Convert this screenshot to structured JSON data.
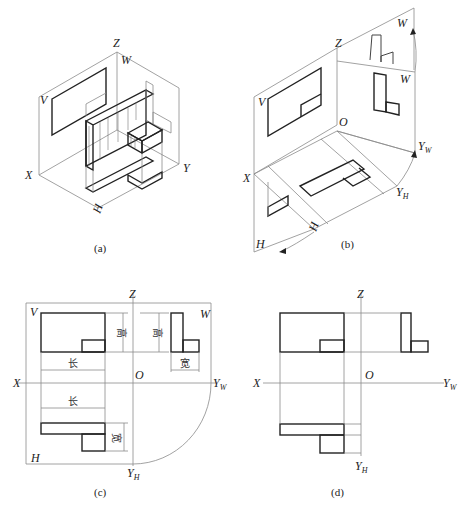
{
  "figure": {
    "panels": [
      {
        "id": "a",
        "caption": "(a)",
        "description": "Isometric view of object placed inside three-projection-plane system",
        "labels": {
          "Z": "Z",
          "W": "W",
          "V": "V",
          "X": "X",
          "Y": "Y",
          "H": "H"
        }
      },
      {
        "id": "b",
        "caption": "(b)",
        "description": "Unfolding of the projection planes (H rotates down, W rotates right)",
        "labels": {
          "Z": "Z",
          "W_top": "W",
          "W": "W",
          "V": "V",
          "O": "O",
          "X": "X",
          "YW": "Y",
          "YW_sub": "W",
          "YH": "Y",
          "YH_sub": "H",
          "H_plane": "H",
          "H": "H"
        }
      },
      {
        "id": "c",
        "caption": "(c)",
        "description": "Unfolded three-view drawing with dimension relations",
        "labels": {
          "Z": "Z",
          "V": "V",
          "W": "W",
          "O": "O",
          "X": "X",
          "YW": "Y",
          "YW_sub": "W",
          "H": "H",
          "YH": "Y",
          "YH_sub": "H"
        },
        "dimensions": {
          "height_front": "高",
          "height_side": "高",
          "width_side": "宽",
          "length_front": "长",
          "length_top": "长",
          "width_top": "宽"
        }
      },
      {
        "id": "d",
        "caption": "(d)",
        "description": "Final three-view drawing with projection lines",
        "labels": {
          "Z": "Z",
          "O": "O",
          "X": "X",
          "YW": "Y",
          "YW_sub": "W",
          "YH": "Y",
          "YH_sub": "H"
        }
      }
    ]
  }
}
